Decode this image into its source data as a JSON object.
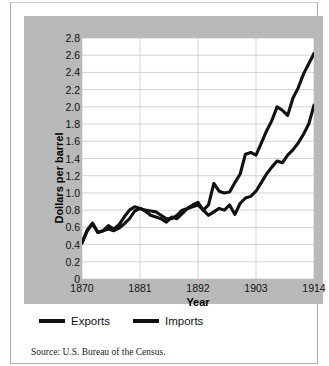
{
  "figure": {
    "source_note": "Source: U.S. Bureau of the Census.",
    "panel_color": "#b9b9b9",
    "plot_background": "#ffffff",
    "line_color": "#111111"
  },
  "legend": {
    "position": "below-plot",
    "items": [
      {
        "label": "Exports",
        "swatch": "line-swatch"
      },
      {
        "label": "Imports",
        "swatch": "line-swatch"
      }
    ]
  },
  "chart_data": {
    "type": "line",
    "title": "",
    "subtitle": "",
    "xlabel": "Year",
    "ylabel": "Dollars per barrel",
    "xlim": [
      1870,
      1914
    ],
    "ylim": [
      0,
      2.8
    ],
    "xticks": [
      1870,
      1881,
      1892,
      1903,
      1914
    ],
    "xticklabels": [
      "1870",
      "1881",
      "1892",
      "1903",
      "1914"
    ],
    "yticks": [
      0,
      0.2,
      0.4,
      0.6,
      0.8,
      1.0,
      1.2,
      1.4,
      1.6,
      1.8,
      2.0,
      2.2,
      2.4,
      2.6,
      2.8
    ],
    "yticklabels": [
      "0",
      "0.2",
      "0.4",
      "0.6",
      "0.8",
      "1.0",
      "1.2",
      "1.4",
      "1.6",
      "1.8",
      "2.0",
      "2.2",
      "2.4",
      "2.6",
      "2.8"
    ],
    "grid": {
      "horizontal": true,
      "vertical": true,
      "color": "#c8c8c8"
    },
    "legend_position": "below",
    "x": [
      1870,
      1871,
      1872,
      1873,
      1874,
      1875,
      1876,
      1877,
      1878,
      1879,
      1880,
      1881,
      1882,
      1883,
      1884,
      1885,
      1886,
      1887,
      1888,
      1889,
      1890,
      1891,
      1892,
      1893,
      1894,
      1895,
      1896,
      1897,
      1898,
      1899,
      1900,
      1901,
      1902,
      1903,
      1904,
      1905,
      1906,
      1907,
      1908,
      1909,
      1910,
      1911,
      1912,
      1913,
      1914
    ],
    "series": [
      {
        "name": "Exports",
        "values": [
          0.42,
          0.57,
          0.65,
          0.54,
          0.56,
          0.62,
          0.58,
          0.63,
          0.72,
          0.8,
          0.84,
          0.82,
          0.8,
          0.79,
          0.78,
          0.74,
          0.7,
          0.7,
          0.74,
          0.8,
          0.82,
          0.86,
          0.89,
          0.8,
          0.86,
          1.11,
          1.02,
          1.0,
          1.01,
          1.12,
          1.22,
          1.45,
          1.47,
          1.44,
          1.58,
          1.72,
          1.84,
          2.0,
          1.96,
          1.9,
          2.1,
          2.22,
          2.38,
          2.5,
          2.62
        ]
      },
      {
        "name": "Imports",
        "values": [
          0.42,
          0.56,
          0.64,
          0.54,
          0.56,
          0.58,
          0.56,
          0.59,
          0.64,
          0.7,
          0.79,
          0.82,
          0.79,
          0.74,
          0.72,
          0.7,
          0.66,
          0.72,
          0.7,
          0.76,
          0.82,
          0.84,
          0.86,
          0.8,
          0.74,
          0.78,
          0.82,
          0.8,
          0.86,
          0.75,
          0.88,
          0.94,
          0.96,
          1.02,
          1.12,
          1.22,
          1.3,
          1.37,
          1.35,
          1.44,
          1.5,
          1.58,
          1.68,
          1.8,
          2.02
        ]
      }
    ]
  }
}
